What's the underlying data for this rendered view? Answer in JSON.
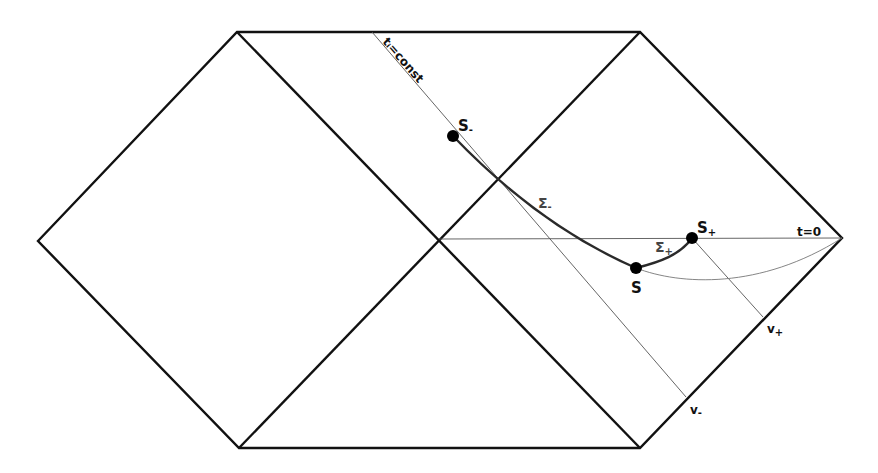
{
  "diagram": {
    "colors": {
      "boundary": "#111111",
      "thin_line": "#555555",
      "slice_curve": "#2a2a2a",
      "dot": "#000000",
      "sigma_label": "#444444"
    },
    "regions": {
      "left_diamond": {
        "left": [
          38,
          241
        ],
        "top": [
          237,
          32
        ],
        "center": [
          439,
          239
        ],
        "bottom": [
          239,
          448
        ]
      },
      "right_diamond": {
        "center": [
          439,
          239
        ],
        "top": [
          640,
          32
        ],
        "right": [
          842,
          238
        ],
        "bottom": [
          640,
          448
        ]
      }
    },
    "labels": {
      "t_const": "tᵢ=const",
      "t_zero": "t=0",
      "s_minus": {
        "main": "S",
        "sub": "-"
      },
      "s": "S",
      "s_plus": {
        "main": "S",
        "sub": "+"
      },
      "sigma_minus": {
        "main": "Σ",
        "sub": "-"
      },
      "sigma_plus": {
        "main": "Σ",
        "sub": "+"
      },
      "v_minus": {
        "main": "v",
        "sub": "-"
      },
      "v_plus": {
        "main": "v",
        "sub": "+"
      }
    },
    "points": {
      "S_minus": [
        453,
        136
      ],
      "S": [
        636,
        268
      ],
      "S_plus": [
        692,
        238
      ]
    }
  }
}
